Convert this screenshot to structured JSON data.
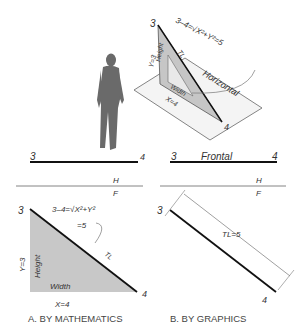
{
  "figure": {
    "isometric": {
      "point_3": "3",
      "point_4": "4",
      "formula": "3–4=√X²+Y²=5",
      "tl": "TL",
      "height": "Height",
      "width": "Width",
      "y_eq": "Y=3",
      "x_eq": "X=4",
      "plane_label": "Horizontal"
    },
    "panel_a": {
      "top_point_3": "3",
      "top_point_4": "4",
      "fold_h": "H",
      "fold_f": "F",
      "point_3": "3",
      "point_4": "4",
      "formula_line1": "3–4=√X²+Y²",
      "formula_line2": "=5",
      "tl": "TL",
      "height": "Height",
      "width": "Width",
      "y_eq": "Y=3",
      "x_eq": "X=4",
      "caption": "A. BY MATHEMATICS"
    },
    "panel_b": {
      "top_point_3": "3",
      "top_label": "Frontal",
      "top_point_4": "4",
      "fold_h": "H",
      "fold_f": "F",
      "point_3": "3",
      "point_4": "4",
      "tl_eq": "TL=5",
      "caption": "B. BY GRAPHICS"
    },
    "colors": {
      "line": "#111111",
      "fill_gray": "#c8c8c8",
      "thin": "#777777"
    }
  }
}
